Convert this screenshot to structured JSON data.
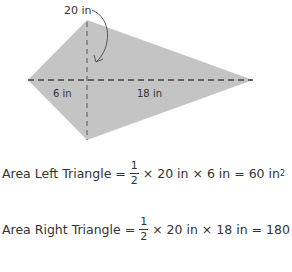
{
  "diagram": {
    "shape": "kite",
    "labels": {
      "height": "20 in",
      "left_base": "6 in",
      "right_base": "18 in"
    },
    "colors": {
      "fill": "#c4c4c4",
      "dash": "#444444"
    }
  },
  "equations": [
    {
      "lhs": "Area Left Triangle =",
      "num": "1",
      "den": "2",
      "rhs": "× 20 in × 6 in = 60 in",
      "sup": "2"
    },
    {
      "lhs": "Area Right Triangle =",
      "num": "1",
      "den": "2",
      "rhs": "× 20 in × 18 in = 180 in",
      "sup": "2"
    }
  ]
}
